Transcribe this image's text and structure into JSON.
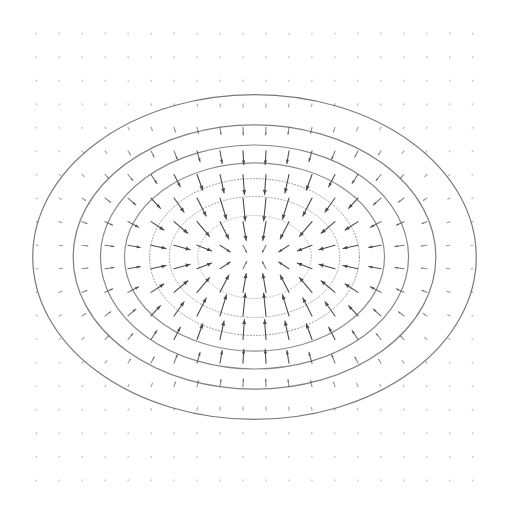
{
  "chart_data": {
    "type": "quiver",
    "title": "",
    "xlabel": "",
    "ylabel": "",
    "xlim": [
      -2,
      2
    ],
    "ylim": [
      -2,
      2
    ],
    "grid": false,
    "axes_visible": false,
    "legend": "none",
    "vector_field": {
      "description": "gradient of elliptical Gaussian bump, arrows point toward center",
      "potential": "exp(-(x^2 + (k*y)^2))",
      "k": 1.4,
      "grid_nx": 20,
      "grid_ny": 20,
      "x_range": [
        -2,
        2
      ],
      "y_range": [
        -2,
        2
      ],
      "arrow_color": "#4a4a4a"
    },
    "contours": [
      {
        "level_index": 0,
        "rx": 2.03,
        "ry": 1.45,
        "color": "#7a7a7a"
      },
      {
        "level_index": 1,
        "rx": 1.66,
        "ry": 1.18,
        "color": "#808080"
      },
      {
        "level_index": 2,
        "rx": 1.41,
        "ry": 1.0,
        "color": "#868686"
      },
      {
        "level_index": 3,
        "rx": 1.19,
        "ry": 0.84,
        "color": "#8e8e8e"
      },
      {
        "level_index": 4,
        "rx": 0.96,
        "ry": 0.7,
        "color": "#989898"
      },
      {
        "level_index": 5,
        "rx": 0.78,
        "ry": 0.54,
        "color": "#a6a6a6"
      },
      {
        "level_index": 6,
        "rx": 0.52,
        "ry": 0.37,
        "color": "#bdbdbd"
      }
    ],
    "center": [
      0,
      0
    ]
  }
}
